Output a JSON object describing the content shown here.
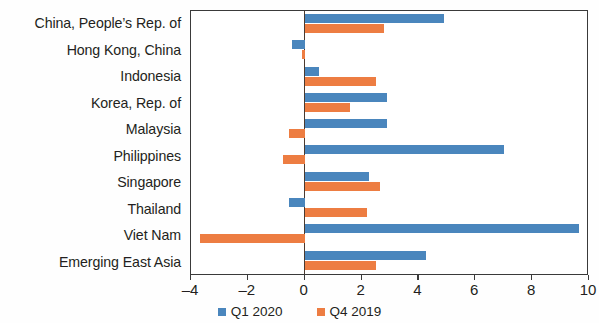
{
  "chart_data": {
    "type": "bar",
    "orientation": "horizontal",
    "title": "",
    "subtitle": "",
    "xlabel": "",
    "ylabel": "",
    "xlim": [
      -4,
      10
    ],
    "xticks": [
      -4,
      -2,
      0,
      2,
      4,
      6,
      8,
      10
    ],
    "xtick_labels": [
      "–4",
      "–2",
      "0",
      "2",
      "4",
      "6",
      "8",
      "10"
    ],
    "grid": false,
    "legend_position": "bottom-center",
    "categories": [
      "China, People’s Rep. of",
      "Hong Kong, China",
      "Indonesia",
      "Korea, Rep. of",
      "Malaysia",
      "Philippines",
      "Singapore",
      "Thailand",
      "Viet Nam",
      "Emerging East Asia"
    ],
    "series": [
      {
        "name": "Q1 2020",
        "color": "#4a86bd",
        "values": [
          4.9,
          -0.45,
          0.5,
          2.9,
          2.9,
          7.0,
          2.25,
          -0.55,
          9.65,
          4.25
        ]
      },
      {
        "name": "Q4 2019",
        "color": "#ed7d42",
        "values": [
          2.8,
          -0.1,
          2.5,
          1.6,
          -0.55,
          -0.75,
          2.65,
          2.2,
          -3.7,
          2.5
        ]
      }
    ]
  },
  "legend": {
    "items": [
      {
        "label": "Q1 2020",
        "color": "#4a86bd",
        "swatch_name": "legend-swatch-q1-2020"
      },
      {
        "label": "Q4 2019",
        "color": "#ed7d42",
        "swatch_name": "legend-swatch-q4-2019"
      }
    ]
  },
  "colors": {
    "series_q1_2020": "#4a86bd",
    "series_q4_2019": "#ed7d42",
    "axis": "#3a3a3a",
    "text": "#231f20",
    "background": "#ffffff"
  }
}
